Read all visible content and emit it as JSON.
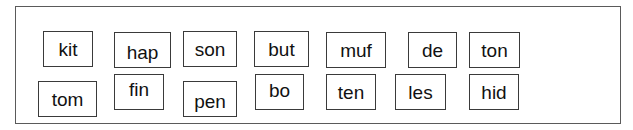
{
  "worksheet": {
    "cards": [
      {
        "word": "kit",
        "row": 1,
        "box": {
          "x": 43,
          "y": 31,
          "w": 50,
          "h": 36
        },
        "text_dy": 0
      },
      {
        "word": "hap",
        "row": 1,
        "box": {
          "x": 114,
          "y": 32,
          "w": 57,
          "h": 36
        },
        "text_dy": 2
      },
      {
        "word": "son",
        "row": 1,
        "box": {
          "x": 183,
          "y": 31,
          "w": 54,
          "h": 36
        },
        "text_dy": 0
      },
      {
        "word": "but",
        "row": 1,
        "box": {
          "x": 254,
          "y": 31,
          "w": 55,
          "h": 36
        },
        "text_dy": 0
      },
      {
        "word": "muf",
        "row": 1,
        "box": {
          "x": 326,
          "y": 32,
          "w": 60,
          "h": 36
        },
        "text_dy": 0
      },
      {
        "word": "de",
        "row": 1,
        "box": {
          "x": 408,
          "y": 32,
          "w": 49,
          "h": 36
        },
        "text_dy": 0
      },
      {
        "word": "ton",
        "row": 1,
        "box": {
          "x": 469,
          "y": 32,
          "w": 51,
          "h": 36
        },
        "text_dy": 0
      },
      {
        "word": "tom",
        "row": 2,
        "box": {
          "x": 38,
          "y": 81,
          "w": 59,
          "h": 36
        },
        "text_dy": 0
      },
      {
        "word": "fin",
        "row": 2,
        "box": {
          "x": 114,
          "y": 74,
          "w": 50,
          "h": 36
        },
        "text_dy": -3
      },
      {
        "word": "pen",
        "row": 2,
        "box": {
          "x": 183,
          "y": 81,
          "w": 54,
          "h": 36
        },
        "text_dy": 2
      },
      {
        "word": "bo",
        "row": 2,
        "box": {
          "x": 255,
          "y": 74,
          "w": 49,
          "h": 36
        },
        "text_dy": -2
      },
      {
        "word": "ten",
        "row": 2,
        "box": {
          "x": 326,
          "y": 74,
          "w": 50,
          "h": 36
        },
        "text_dy": 0
      },
      {
        "word": "les",
        "row": 2,
        "box": {
          "x": 395,
          "y": 74,
          "w": 51,
          "h": 36
        },
        "text_dy": 0
      },
      {
        "word": "hid",
        "row": 2,
        "box": {
          "x": 469,
          "y": 74,
          "w": 50,
          "h": 36
        },
        "text_dy": 0
      }
    ]
  },
  "colors": {
    "frame_border": "#5a5a5a",
    "card_border": "#3a3a3a",
    "text": "#111111",
    "background": "#ffffff"
  }
}
